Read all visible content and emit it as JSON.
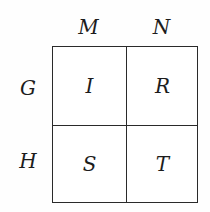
{
  "figure": {
    "type": "two-by-two-table",
    "background_color": "#fefefe",
    "line_color": "#2a2a2a",
    "text_color": "#1c1c1c"
  },
  "table": {
    "column_headers": [
      "M",
      "N"
    ],
    "row_labels": [
      "G",
      "H"
    ],
    "cells": [
      [
        "I",
        "R"
      ],
      [
        "S",
        "T"
      ]
    ]
  }
}
